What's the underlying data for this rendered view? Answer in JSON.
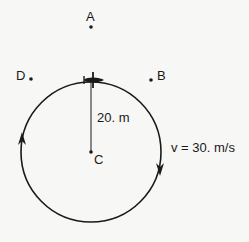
{
  "diagram": {
    "type": "circular-motion",
    "points": {
      "A": {
        "label": "A"
      },
      "B": {
        "label": "B"
      },
      "C": {
        "label": "C"
      },
      "D": {
        "label": "D"
      }
    },
    "radius_label": "20. m",
    "velocity_label": "v = 30. m/s",
    "direction": "clockwise",
    "object": "airplane",
    "colors": {
      "ink": "#1a1a1a",
      "background": "#f7f7f5"
    }
  }
}
